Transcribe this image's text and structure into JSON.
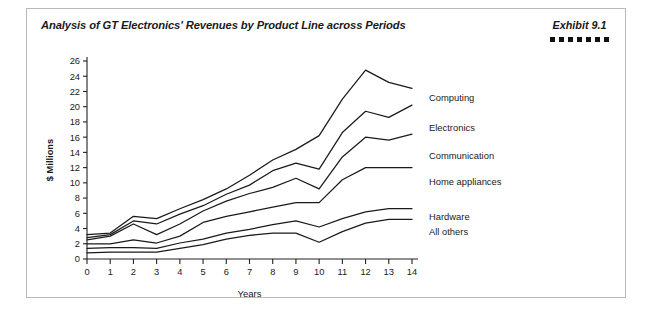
{
  "card": {
    "title": "Analysis of GT Electronics' Revenues by Product Line across Periods",
    "exhibit_label": "Exhibit 9.1",
    "exhibit_square_count": 7,
    "border_color": "#b9b9b9",
    "background_color": "#ffffff"
  },
  "chart_data": {
    "type": "line",
    "title": "Analysis of GT Electronics' Revenues by Product Line across Periods",
    "xlabel": "Years",
    "ylabel": "$ Millions",
    "xlim": [
      0,
      14
    ],
    "ylim": [
      0,
      26
    ],
    "grid": false,
    "legend_position": "right-inline-labels",
    "line_color": "#1a1a1a",
    "x": [
      0,
      1,
      2,
      3,
      4,
      5,
      6,
      7,
      8,
      9,
      10,
      11,
      12,
      13,
      14
    ],
    "xticks": [
      "0",
      "1",
      "2",
      "3",
      "4",
      "5",
      "6",
      "7",
      "8",
      "9",
      "10",
      "11",
      "12",
      "13",
      "14"
    ],
    "yticks": [
      "0",
      "2",
      "4",
      "6",
      "8",
      "10",
      "12",
      "14",
      "16",
      "18",
      "20",
      "22",
      "24",
      "26"
    ],
    "series": [
      {
        "name": "Computing",
        "label": "Computing",
        "values": [
          3.2,
          3.4,
          5.6,
          5.3,
          6.6,
          7.8,
          9.2,
          11.0,
          13.0,
          14.4,
          16.2,
          21.0,
          24.8,
          23.2,
          22.4
        ]
      },
      {
        "name": "Electronics",
        "label": "Electronics",
        "values": [
          2.8,
          3.2,
          5.0,
          4.6,
          5.9,
          7.0,
          8.5,
          9.7,
          11.6,
          12.6,
          11.8,
          16.6,
          19.4,
          18.6,
          20.2
        ]
      },
      {
        "name": "Communication",
        "label": "Communication",
        "values": [
          2.5,
          3.0,
          4.6,
          3.2,
          4.6,
          6.3,
          7.6,
          8.6,
          9.4,
          10.6,
          9.2,
          13.4,
          16.0,
          15.6,
          16.4
        ]
      },
      {
        "name": "Home appliances",
        "label": "Home appliances",
        "values": [
          2.0,
          2.0,
          2.5,
          2.1,
          3.0,
          4.8,
          5.6,
          6.2,
          6.8,
          7.4,
          7.4,
          10.4,
          12.0,
          12.0,
          12.0
        ]
      },
      {
        "name": "Hardware",
        "label": "Hardware",
        "values": [
          1.4,
          1.5,
          1.5,
          1.4,
          2.1,
          2.6,
          3.4,
          3.9,
          4.5,
          5.0,
          4.2,
          5.3,
          6.2,
          6.6,
          6.6
        ]
      },
      {
        "name": "All others",
        "label": "All others",
        "values": [
          0.8,
          0.9,
          0.9,
          0.9,
          1.4,
          1.9,
          2.6,
          3.1,
          3.4,
          3.4,
          2.2,
          3.6,
          4.7,
          5.2,
          5.2
        ]
      }
    ]
  }
}
